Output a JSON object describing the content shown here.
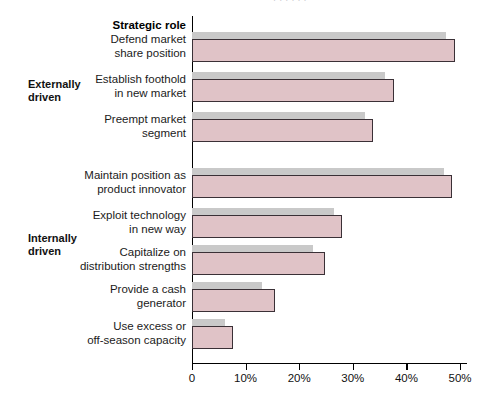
{
  "top_caption": "· · ·  ·    ·  ·",
  "axis_header": "Strategic role",
  "groups": [
    {
      "id": "externally",
      "label": "Externally\ndriven"
    },
    {
      "id": "internally",
      "label": "Internally\ndriven"
    }
  ],
  "axis": {
    "ticks": [
      "0",
      "10%",
      "20%",
      "30%",
      "40%",
      "50%"
    ],
    "tick_values": [
      0,
      10,
      20,
      30,
      40,
      50
    ],
    "xmin": 0,
    "xmax": 50
  },
  "chart_data": {
    "type": "bar",
    "orientation": "horizontal",
    "title": "Strategic role",
    "xlabel": "",
    "ylabel": "",
    "xlim": [
      0,
      50
    ],
    "grid": false,
    "legend": "none",
    "units": "percent",
    "categories": [
      "Defend market\nshare position",
      "Establish foothold\nin new market",
      "Preempt market\nsegment",
      "Maintain position as\nproduct innovator",
      "Exploit technology\nin new way",
      "Capitalize on\ndistribution strengths",
      "Provide a cash\ngenerator",
      "Use excess or\noff-season capacity"
    ],
    "category_groups": [
      "Externally driven",
      "Externally driven",
      "Externally driven",
      "Internally driven",
      "Internally driven",
      "Internally driven",
      "Internally driven",
      "Internally driven"
    ],
    "series": [
      {
        "name": "gray",
        "color": "#c9c9c9",
        "values": [
          47.4,
          36.0,
          32.3,
          47.0,
          26.5,
          22.6,
          13.0,
          6.2
        ]
      },
      {
        "name": "pink",
        "color": "#e0c3c7",
        "values": [
          49.0,
          37.7,
          33.8,
          48.5,
          28.0,
          24.8,
          15.5,
          7.6
        ]
      }
    ]
  },
  "colors": {
    "pink_fill": "#e0c3c7",
    "pink_border": "#3a3036",
    "gray_fill": "#c9c9c9",
    "axis": "#000000",
    "text": "#111111"
  }
}
